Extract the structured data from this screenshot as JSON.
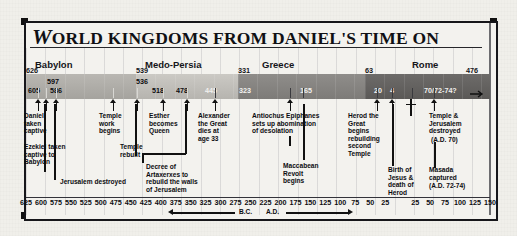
{
  "title": {
    "drop_cap": "W",
    "rest": "ORLD KINGDOMS FROM DANIEL'S TIME ON",
    "full": "World Kingdoms From Daniel's Time On"
  },
  "chart_data": {
    "type": "timeline",
    "title": "World Kingdoms From Daniel's Time On",
    "xlabel": "",
    "ylabel": "",
    "axis": {
      "range_bc_start": 625,
      "range_ad_end": 150,
      "tick_step": 25,
      "bc_ticks": [
        625,
        600,
        575,
        550,
        525,
        500,
        475,
        450,
        425,
        400,
        375,
        350,
        325,
        300,
        275,
        250,
        225,
        200,
        175,
        150,
        125,
        100,
        75,
        50,
        25
      ],
      "ad_ticks": [
        25,
        50,
        75,
        100,
        125,
        150
      ],
      "bc_label": "B.C.",
      "ad_label": "A.D.",
      "grid": true
    },
    "eras": [
      {
        "name": "Babylon",
        "start_year": 626,
        "start_label": "626",
        "end_year": 539,
        "shade": "#ada9a4"
      },
      {
        "name": "Medo-Persia",
        "start_year": 539,
        "start_label": "539",
        "end_year": 331,
        "shade": "#c0beb9"
      },
      {
        "name": "Greece",
        "start_year": 331,
        "start_label": "331",
        "end_year": 63,
        "shade": "#868482"
      },
      {
        "name": "Rome",
        "start_year": 63,
        "start_label": "63",
        "end_year": -476,
        "end_label": "476",
        "shade": "#63615f"
      }
    ],
    "year_markers": [
      {
        "label": "605",
        "year": 605,
        "era": "Babylon"
      },
      {
        "label": "597",
        "year": 597,
        "era": "Babylon"
      },
      {
        "label": "586",
        "year": 586,
        "era": "Babylon"
      },
      {
        "label": "536",
        "year": 536,
        "era": "Medo-Persia"
      },
      {
        "label": "518",
        "year": 518,
        "era": "Medo-Persia"
      },
      {
        "label": "478",
        "year": 478,
        "era": "Medo-Persia"
      },
      {
        "label": "445",
        "year": 445,
        "era": "Medo-Persia"
      },
      {
        "label": "323",
        "year": 323,
        "era": "Greece"
      },
      {
        "label": "165",
        "year": 165,
        "era": "Greece"
      },
      {
        "label": "20",
        "year": 20,
        "era": "Rome"
      },
      {
        "label": "4",
        "year": 4,
        "era": "Rome"
      },
      {
        "label": "70/72-74?",
        "year": -72,
        "era": "Rome"
      }
    ],
    "events": [
      {
        "id": "daniel-captive",
        "label": "Daniel\ntaken\ncaptive",
        "year": 605
      },
      {
        "id": "ezekiel-captive",
        "label": "Ezekiel taken\ncaptive to\nBabylon",
        "year": 597
      },
      {
        "id": "jerusalem-destroyed",
        "label": "Jerusalem destroyed",
        "year": 586
      },
      {
        "id": "temple-work-begins",
        "label": "Temple\nwork\nbegins",
        "year": 536
      },
      {
        "id": "temple-rebuilt",
        "label": "Temple\nrebuilt",
        "year": 516
      },
      {
        "id": "esther-queen",
        "label": "Esther\nbecomes\nQueen",
        "year": 478
      },
      {
        "id": "decree-artaxerxes",
        "label": "Decree of\nArtaxerxes to\nrebuild the walls\nof Jerusalem",
        "year": 445
      },
      {
        "id": "alexander-dies",
        "label": "Alexander\nthe Great\ndies at\nage 33",
        "year": 323
      },
      {
        "id": "antiochus",
        "label": "Antiochus Epiphanes\nsets up abomination\nof desolation",
        "year": 168
      },
      {
        "id": "maccabean-revolt",
        "label": "Maccabean\nRevolt\nbegins",
        "year": 165
      },
      {
        "id": "herod-temple",
        "label": "Herod the\nGreat\nbegins\nrebuilding\nsecond\nTemple",
        "year": 20
      },
      {
        "id": "birth-of-jesus",
        "label": "Birth of\nJesus &\ndeath of\nHerod",
        "year": 4
      },
      {
        "id": "crucifixion",
        "label": "",
        "year": -33,
        "icon": "cross-icon"
      },
      {
        "id": "temple-jerusalem-destroyed",
        "label": "Temple &\nJerusalem\ndestroyed",
        "sub": "(A.D. 70)",
        "year": -70
      },
      {
        "id": "masada-captured",
        "label": "Masada\ncaptured",
        "sub": "(A.D. 72-74)",
        "year": -73
      }
    ]
  },
  "colors": {
    "ink": "#111116",
    "paper": "#f0efea",
    "band_babylon": "#ada9a4",
    "band_medo": "#c0beb9",
    "band_greece": "#868482",
    "band_rome": "#63615f"
  }
}
